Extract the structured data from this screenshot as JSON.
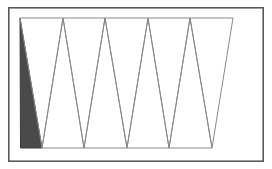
{
  "figure": {
    "width": 272,
    "height": 169,
    "background_color": "#ffffff",
    "panel": {
      "x": 8,
      "y": 7,
      "width": 256,
      "height": 155,
      "fill_color": "#ffffff",
      "border_color": "#5a5a5a",
      "border_width": 1.6
    },
    "strip": {
      "top_y": 18,
      "bottom_y": 148,
      "stroke_color": "#8a8a8a",
      "stroke_width": 1.0,
      "filled_fill_color": "#4a4a4a",
      "filled_stroke_color": "#3c3c3c",
      "vertex_count": 11,
      "triangle_count": 9,
      "top_vertices_x": [
        20,
        63,
        105,
        148,
        190,
        233
      ],
      "bottom_vertices_x": [
        42,
        84,
        127,
        169,
        212
      ],
      "comment_vertices": "alternating top/bottom vertex chain forming a zigzag triangle strip"
    },
    "triangles": [
      {
        "index": 1,
        "label": "triangle-1-filled",
        "orientation": "apex-up",
        "filled": true,
        "points": "20,18 42,148 20.5,148"
      },
      {
        "index": 2,
        "label": "triangle-2",
        "orientation": "apex-down",
        "filled": false,
        "points": "20,18 63,18 42,148"
      },
      {
        "index": 3,
        "label": "triangle-3",
        "orientation": "apex-up",
        "filled": false,
        "points": "63,18 42,148 84,148"
      },
      {
        "index": 4,
        "label": "triangle-4",
        "orientation": "apex-down",
        "filled": false,
        "points": "63,18 105,18 84,148"
      },
      {
        "index": 5,
        "label": "triangle-5",
        "orientation": "apex-up",
        "filled": false,
        "points": "105,18 84,148 127,148"
      },
      {
        "index": 6,
        "label": "triangle-6",
        "orientation": "apex-down",
        "filled": false,
        "points": "105,18 148,18 127,148"
      },
      {
        "index": 7,
        "label": "triangle-7",
        "orientation": "apex-up",
        "filled": false,
        "points": "148,18 127,148 169,148"
      },
      {
        "index": 8,
        "label": "triangle-8",
        "orientation": "apex-down",
        "filled": false,
        "points": "148,18 190,18 169,148"
      },
      {
        "index": 9,
        "label": "triangle-9",
        "orientation": "apex-up",
        "filled": false,
        "points": "190,18 169,148 212,148"
      },
      {
        "index": 10,
        "label": "triangle-10",
        "orientation": "apex-down",
        "filled": false,
        "points": "190,18 233,18 212,148"
      }
    ]
  }
}
